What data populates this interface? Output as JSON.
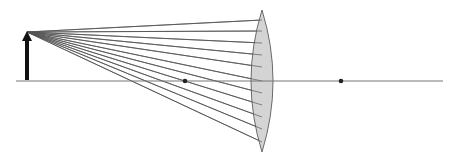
{
  "diagram": {
    "type": "optics-converging-lens-ray-diagram",
    "width": 458,
    "height": 161,
    "colors": {
      "background": "#ffffff",
      "ray": "#555555",
      "axis": "#777777",
      "lens_fill": "#d4d4d4",
      "lens_stroke": "#6a6a6a",
      "object": "#111111",
      "focal_point": "#222222"
    },
    "optical_axis": {
      "x1": 16,
      "x2": 443,
      "y": 81
    },
    "object_arrow": {
      "x": 27,
      "base_y": 80,
      "tip_y": 31
    },
    "lens": {
      "center_x": 262,
      "top_y": 10,
      "bottom_y": 152,
      "axis_y": 81,
      "left_bulge_x": 251,
      "right_bulge_x": 273
    },
    "focal_points": [
      {
        "label": "F-left",
        "x": 185,
        "y": 81
      },
      {
        "label": "F-right",
        "x": 341,
        "y": 81
      }
    ],
    "rays": {
      "origin": {
        "x": 27,
        "y": 32
      },
      "end_x": 262,
      "end_ys": [
        20,
        31,
        43,
        55,
        67,
        81,
        93,
        105,
        117,
        129,
        142
      ]
    }
  }
}
